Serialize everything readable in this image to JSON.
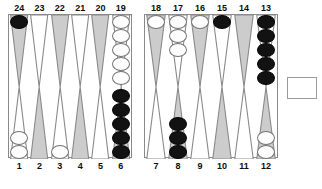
{
  "board": {
    "title": "Backgammon Board Position",
    "colors": {
      "point_shaded": "#cccccc",
      "point_light": "#ffffff",
      "point_outline": "#8a8a8a",
      "checker_white": "#fdfdfd",
      "checker_black": "#121212",
      "frame": "#8a8a8a",
      "background": "#ffffff"
    },
    "top_left_labels": [
      "24",
      "23",
      "22",
      "21",
      "20",
      "19"
    ],
    "top_right_labels": [
      "18",
      "17",
      "16",
      "15",
      "14",
      "13"
    ],
    "bottom_left_labels": [
      "1",
      "2",
      "3",
      "4",
      "5",
      "6"
    ],
    "bottom_right_labels": [
      "7",
      "8",
      "9",
      "10",
      "11",
      "12"
    ],
    "points": [
      {
        "number": "24",
        "quadrant": "top-left",
        "shade": "shaded",
        "checkers": 1,
        "color": "black"
      },
      {
        "number": "23",
        "quadrant": "top-left",
        "shade": "light",
        "checkers": 0,
        "color": "none"
      },
      {
        "number": "22",
        "quadrant": "top-left",
        "shade": "shaded",
        "checkers": 0,
        "color": "none"
      },
      {
        "number": "21",
        "quadrant": "top-left",
        "shade": "light",
        "checkers": 0,
        "color": "none"
      },
      {
        "number": "20",
        "quadrant": "top-left",
        "shade": "shaded",
        "checkers": 0,
        "color": "none"
      },
      {
        "number": "19",
        "quadrant": "top-left",
        "shade": "light",
        "checkers": 5,
        "color": "white"
      },
      {
        "number": "18",
        "quadrant": "top-right",
        "shade": "shaded",
        "checkers": 1,
        "color": "white"
      },
      {
        "number": "17",
        "quadrant": "top-right",
        "shade": "light",
        "checkers": 3,
        "color": "white"
      },
      {
        "number": "16",
        "quadrant": "top-right",
        "shade": "shaded",
        "checkers": 1,
        "color": "white"
      },
      {
        "number": "15",
        "quadrant": "top-right",
        "shade": "light",
        "checkers": 1,
        "color": "black"
      },
      {
        "number": "14",
        "quadrant": "top-right",
        "shade": "shaded",
        "checkers": 0,
        "color": "none"
      },
      {
        "number": "13",
        "quadrant": "top-right",
        "shade": "light",
        "checkers": 5,
        "color": "black"
      },
      {
        "number": "1",
        "quadrant": "bottom-left",
        "shade": "light",
        "checkers": 2,
        "color": "white"
      },
      {
        "number": "2",
        "quadrant": "bottom-left",
        "shade": "shaded",
        "checkers": 0,
        "color": "none"
      },
      {
        "number": "3",
        "quadrant": "bottom-left",
        "shade": "light",
        "checkers": 1,
        "color": "white"
      },
      {
        "number": "4",
        "quadrant": "bottom-left",
        "shade": "shaded",
        "checkers": 0,
        "color": "none"
      },
      {
        "number": "5",
        "quadrant": "bottom-left",
        "shade": "light",
        "checkers": 0,
        "color": "none"
      },
      {
        "number": "6",
        "quadrant": "bottom-left",
        "shade": "shaded",
        "checkers": 5,
        "color": "black"
      },
      {
        "number": "7",
        "quadrant": "bottom-right",
        "shade": "light",
        "checkers": 0,
        "color": "none"
      },
      {
        "number": "8",
        "quadrant": "bottom-right",
        "shade": "shaded",
        "checkers": 3,
        "color": "black"
      },
      {
        "number": "9",
        "quadrant": "bottom-right",
        "shade": "light",
        "checkers": 0,
        "color": "none"
      },
      {
        "number": "10",
        "quadrant": "bottom-right",
        "shade": "shaded",
        "checkers": 0,
        "color": "none"
      },
      {
        "number": "11",
        "quadrant": "bottom-right",
        "shade": "light",
        "checkers": 0,
        "color": "none"
      },
      {
        "number": "12",
        "quadrant": "bottom-right",
        "shade": "shaded",
        "checkers": 2,
        "color": "white"
      }
    ],
    "bar": {
      "white_checkers": 0,
      "black_checkers": 0
    },
    "bearoff_tray": {
      "checkers": 0,
      "label": ""
    }
  }
}
